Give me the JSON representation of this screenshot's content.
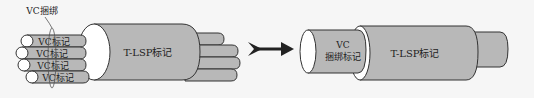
{
  "diagram": {
    "type": "flow",
    "left_group": {
      "callout_label": "VC捆绑",
      "vc_cables": [
        {
          "label": "VC标记"
        },
        {
          "label": "VC标记"
        },
        {
          "label": "VC标记"
        },
        {
          "label": "VC标记"
        }
      ],
      "tunnel_label": "T-LSP标记"
    },
    "arrow": {
      "direction": "right"
    },
    "right_group": {
      "inner_label_line1": "VC",
      "inner_label_line2": "捆绑标记",
      "tunnel_label": "T-LSP标记"
    },
    "colors": {
      "cable_fill": "#b8b8b8",
      "cable_stroke": "#333333",
      "end_cap": "#ffffff",
      "arrow": "#222222",
      "background": "#f6f6f6"
    }
  }
}
